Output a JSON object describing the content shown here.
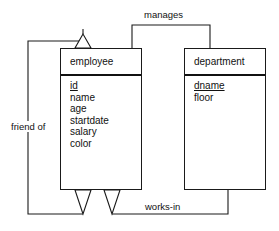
{
  "diagram": {
    "type": "er-diagram",
    "background_color": "#ffffff",
    "line_color": "#1a1a1a",
    "text_color": "#111111",
    "entities": [
      {
        "id": "employee",
        "title": "employee",
        "attributes": [
          {
            "name": "id",
            "key": true
          },
          {
            "name": "name",
            "key": false
          },
          {
            "name": "age",
            "key": false
          },
          {
            "name": "startdate",
            "key": false
          },
          {
            "name": "salary",
            "key": false
          },
          {
            "name": "color",
            "key": false
          }
        ]
      },
      {
        "id": "department",
        "title": "department",
        "attributes": [
          {
            "name": "dname",
            "key": true
          },
          {
            "name": "floor",
            "key": false
          }
        ]
      }
    ],
    "relationships": [
      {
        "id": "manages",
        "label": "manages",
        "from": "department",
        "to": "employee"
      },
      {
        "id": "friend-of",
        "label": "friend of",
        "from": "employee",
        "to": "employee"
      },
      {
        "id": "works-in",
        "label": "works-in",
        "from": "department",
        "to": "employee"
      }
    ]
  }
}
